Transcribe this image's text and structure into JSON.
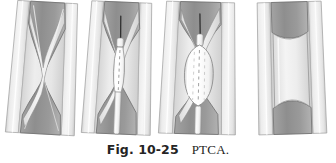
{
  "figure": {
    "caption_label": "Fig. 10-25",
    "caption_title": "PTCA.",
    "background_color": "#ffffff"
  },
  "palette": {
    "vessel_outer_wall": "#e9e9e9",
    "vessel_outer_wall_shadow": "#cfcfcf",
    "vessel_media": "#dcdcdc",
    "vessel_intima": "#f0f0f0",
    "plaque_dark": "#8f8f8f",
    "plaque_mid": "#a8a8a8",
    "plaque_light": "#c4c4c4",
    "lumen_light": "#ededed",
    "lumen_highlight": "#f7f7f7",
    "balloon_fill": "#fbfbfb",
    "balloon_edge": "#9b9b9b",
    "catheter_fill": "#f4f4f4",
    "catheter_marker": "#9a9a9a",
    "guidewire": "#3a3a3a",
    "outline": "#707070",
    "outline_soft": "#9d9d9d"
  },
  "panels": [
    {
      "id": "panel-1",
      "name": "stenosed-artery",
      "order": 1,
      "caption": "Stenosed coronary artery with atherosclerotic plaque narrowing the lumen",
      "x": 8,
      "width": 72,
      "has_catheter": false,
      "has_guidewire": false,
      "balloon_state": "none",
      "lumen_state": "narrowed"
    },
    {
      "id": "panel-2",
      "name": "balloon-catheter-inserted",
      "order": 2,
      "caption": "Balloon catheter advanced over guidewire across the stenosis",
      "x": 83,
      "width": 72,
      "has_catheter": true,
      "has_guidewire": true,
      "balloon_state": "deflated",
      "lumen_state": "narrowed"
    },
    {
      "id": "panel-3",
      "name": "balloon-inflated",
      "order": 3,
      "caption": "Balloon inflated, compressing plaque against the arterial wall",
      "x": 160,
      "width": 78,
      "has_catheter": true,
      "has_guidewire": true,
      "balloon_state": "inflated",
      "lumen_state": "dilated"
    },
    {
      "id": "panel-4",
      "name": "artery-after-angioplasty",
      "order": 4,
      "caption": "Artery after angioplasty with restored blood flow",
      "x": 255,
      "width": 72,
      "has_catheter": false,
      "has_guidewire": false,
      "balloon_state": "none",
      "lumen_state": "open"
    }
  ]
}
